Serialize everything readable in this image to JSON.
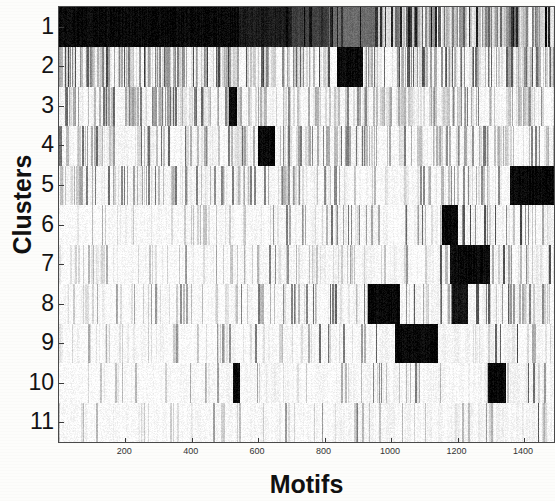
{
  "figure": {
    "title": "",
    "background_color": "#fdfdfb",
    "ink_color": "#000000"
  },
  "axes": {
    "ylabel": "Clusters",
    "xlabel": "Motifs"
  },
  "chart_data": {
    "type": "heatmap",
    "title": "",
    "xlabel": "Motifs",
    "ylabel": "Clusters",
    "grid": false,
    "legend": "none",
    "colormap": "gray_reversed",
    "value_range": [
      0,
      1
    ],
    "xlim": [
      1,
      1490
    ],
    "ylim": [
      0.5,
      11.5
    ],
    "x_tick_values": [
      200,
      400,
      600,
      800,
      1000,
      1200,
      1400
    ],
    "x_tick_labels": [
      "200",
      "400",
      "600",
      "800",
      "1000",
      "1200",
      "1400"
    ],
    "y_tick_values": [
      1,
      2,
      3,
      4,
      5,
      6,
      7,
      8,
      9,
      10,
      11
    ],
    "y_tick_labels": [
      "1",
      "2",
      "3",
      "4",
      "5",
      "6",
      "7",
      "8",
      "9",
      "10",
      "11"
    ],
    "rows": 11,
    "columns": 1490,
    "row_profiles": [
      {
        "cluster": 1,
        "base_density": 0.97,
        "mean_intensity": 0.82,
        "solid_blocks": [
          [
            1,
            540,
            1.0
          ],
          [
            540,
            700,
            0.92
          ],
          [
            700,
            810,
            0.78
          ],
          [
            810,
            960,
            0.6
          ]
        ],
        "stripe_density": 0.88,
        "stripe_dark": 0.85,
        "tail_start": 960,
        "tail_density": 0.55
      },
      {
        "cluster": 2,
        "base_density": 0.8,
        "mean_intensity": 0.55,
        "solid_blocks": [
          [
            835,
            915,
            1.0
          ]
        ],
        "stripe_density": 0.72,
        "stripe_dark": 0.7,
        "tail_start": 0,
        "tail_density": 0.7
      },
      {
        "cluster": 3,
        "base_density": 0.62,
        "mean_intensity": 0.38,
        "solid_blocks": [
          [
            512,
            534,
            1.0
          ]
        ],
        "stripe_density": 0.6,
        "stripe_dark": 0.55,
        "tail_start": 0,
        "tail_density": 0.55
      },
      {
        "cluster": 4,
        "base_density": 0.58,
        "mean_intensity": 0.36,
        "solid_blocks": [
          [
            600,
            650,
            1.0
          ]
        ],
        "stripe_density": 0.56,
        "stripe_dark": 0.55,
        "tail_start": 0,
        "tail_density": 0.5
      },
      {
        "cluster": 5,
        "base_density": 0.42,
        "mean_intensity": 0.3,
        "solid_blocks": [
          [
            1355,
            1490,
            1.0
          ]
        ],
        "stripe_density": 0.45,
        "stripe_dark": 0.5,
        "tail_start": 0,
        "tail_density": 0.42
      },
      {
        "cluster": 6,
        "base_density": 0.2,
        "mean_intensity": 0.14,
        "solid_blocks": [
          [
            1150,
            1200,
            1.0
          ]
        ],
        "stripe_density": 0.22,
        "stripe_dark": 0.45,
        "tail_start": 0,
        "tail_density": 0.22
      },
      {
        "cluster": 7,
        "base_density": 0.26,
        "mean_intensity": 0.2,
        "solid_blocks": [
          [
            1175,
            1295,
            1.0
          ]
        ],
        "stripe_density": 0.28,
        "stripe_dark": 0.45,
        "tail_start": 0,
        "tail_density": 0.3
      },
      {
        "cluster": 8,
        "base_density": 0.3,
        "mean_intensity": 0.26,
        "solid_blocks": [
          [
            930,
            1025,
            1.0
          ],
          [
            1180,
            1230,
            0.95
          ]
        ],
        "stripe_density": 0.34,
        "stripe_dark": 0.5,
        "tail_start": 0,
        "tail_density": 0.4
      },
      {
        "cluster": 9,
        "base_density": 0.24,
        "mean_intensity": 0.22,
        "solid_blocks": [
          [
            1010,
            1140,
            1.0
          ]
        ],
        "stripe_density": 0.28,
        "stripe_dark": 0.48,
        "tail_start": 0,
        "tail_density": 0.32
      },
      {
        "cluster": 10,
        "base_density": 0.14,
        "mean_intensity": 0.12,
        "solid_blocks": [
          [
            522,
            545,
            1.0
          ],
          [
            1290,
            1345,
            1.0
          ]
        ],
        "stripe_density": 0.16,
        "stripe_dark": 0.4,
        "tail_start": 0,
        "tail_density": 0.18
      },
      {
        "cluster": 11,
        "base_density": 0.13,
        "mean_intensity": 0.1,
        "solid_blocks": [],
        "stripe_density": 0.15,
        "stripe_dark": 0.4,
        "tail_start": 0,
        "tail_density": 0.16
      }
    ]
  }
}
